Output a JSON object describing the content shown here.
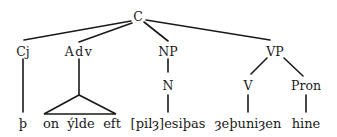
{
  "diagram": {
    "type": "syntax-tree",
    "nodes": {
      "root": {
        "label": "C"
      },
      "cj": {
        "label": "Cj"
      },
      "adv": {
        "label": "Adv"
      },
      "np": {
        "label": "NP"
      },
      "vp": {
        "label": "VP"
      },
      "n": {
        "label": "N"
      },
      "v": {
        "label": "V"
      },
      "pron": {
        "label": "Pron"
      }
    },
    "leaves": {
      "cj_word": "þ",
      "adv_words": [
        "on",
        "ýlde",
        "eft"
      ],
      "n_word": "[pilȝ]esiþas",
      "v_word": "ȝeþuniȝen",
      "pron_word": "hine"
    },
    "edges": [
      [
        "C",
        "Cj"
      ],
      [
        "C",
        "Adv"
      ],
      [
        "C",
        "NP"
      ],
      [
        "C",
        "VP"
      ],
      [
        "Cj",
        "þ"
      ],
      [
        "Adv",
        "triangle: on ýlde eft"
      ],
      [
        "NP",
        "N"
      ],
      [
        "N",
        "[pilȝ]esiþas"
      ],
      [
        "VP",
        "V"
      ],
      [
        "VP",
        "Pron"
      ],
      [
        "V",
        "ȝeþuniȝen"
      ],
      [
        "Pron",
        "hine"
      ]
    ]
  }
}
